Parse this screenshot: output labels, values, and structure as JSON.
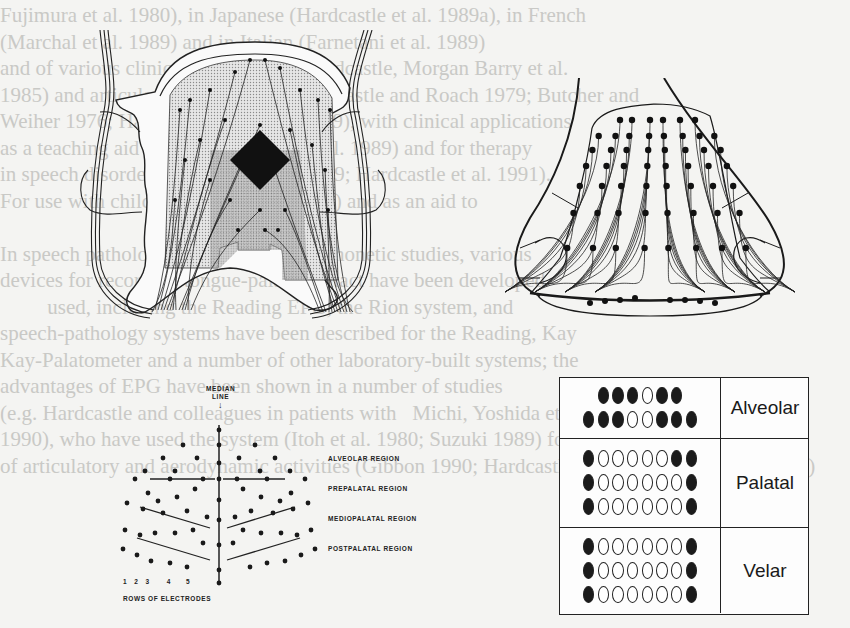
{
  "page": {
    "background_text_lines": [
      "Fujimura et al. 1980), in Japanese (Hardcastle et al. 1989a), in French",
      "(Marchal et al. 1989) and in Italian (Farnetani et al. 1989)",
      "and of various clinical populations (Hardcastle, Morgan Barry et al.",
      "1985) and articulatory timing (e.g. Hardcastle and Roach 1979; Butcher and",
      "Weiher 1976; Hardcastle and Clark 1989), with clinical applications",
      "as a teaching aid (Hardcastle, Jones et al. 1989) and for therapy",
      "in speech disorders (Dagenais et al. 1989; Hardcastle et al. 1991).",
      "For use with children (Michi et al. 1986) and as an aid to",
      "                                     analysis.",
      "In speech pathology, as in   normative phonetic studies, various",
      "devices for recording tongue-palate contact have been developed",
      "         used, including the Reading EPG, the Rion system, and",
      "speech-pathology systems have been described for the Reading, Kay",
      "Kay-Palatometer and a number of other laboratory-built systems; the",
      "advantages of EPG have been shown in a number of studies",
      "(e.g. Hardcastle and colleagues in patients with   Michi, Yoshida et al.",
      "1990), who have used the system (Itoh et al. 1980; Suzuki 1989) for observation",
      "of articulatory and aerodynamic activities (Gibbon 1990; Hardcastle, Edwards and Gibbon 1989)"
    ]
  },
  "figure": {
    "panel_a": {
      "description": "Artificial palate with embedded electrodes and lead wires, central connector block",
      "icon": "artificial-palate-electrodes-illustration"
    },
    "panel_b": {
      "description": "Palate plate outline with electrode array and wiring",
      "icon": "palate-plate-electrode-array-illustration"
    },
    "panel_c": {
      "median_label_line1": "MEDIAN",
      "median_label_line2": "LINE",
      "median_arrow": "↓",
      "regions": [
        "ALVEOLAR REGION",
        "PREPALATAL REGION",
        "MEDIOPALATAL REGION",
        "POSTPALATAL REGION"
      ],
      "row_numbers": [
        "1",
        "2",
        "3",
        "4",
        "5"
      ],
      "rows_caption": "ROWS OF ELECTRODES"
    },
    "panel_d": {
      "zones": [
        {
          "label": "Alveolar",
          "rows": [
            [
              null,
              1,
              1,
              1,
              0,
              1,
              1,
              null
            ],
            [
              1,
              1,
              1,
              0,
              0,
              1,
              1,
              1
            ]
          ]
        },
        {
          "label": "Palatal",
          "rows": [
            [
              1,
              0,
              0,
              0,
              0,
              0,
              1,
              1
            ],
            [
              1,
              0,
              0,
              0,
              0,
              0,
              0,
              1
            ],
            [
              1,
              0,
              0,
              0,
              0,
              0,
              0,
              1
            ]
          ]
        },
        {
          "label": "Velar",
          "rows": [
            [
              1,
              0,
              0,
              0,
              0,
              0,
              0,
              1
            ],
            [
              1,
              0,
              0,
              0,
              0,
              0,
              0,
              1
            ],
            [
              1,
              0,
              0,
              0,
              0,
              0,
              0,
              1
            ]
          ]
        }
      ],
      "legend": {
        "contact_color": "#1b1b1b",
        "no_contact_color": "#ffffff"
      }
    }
  }
}
